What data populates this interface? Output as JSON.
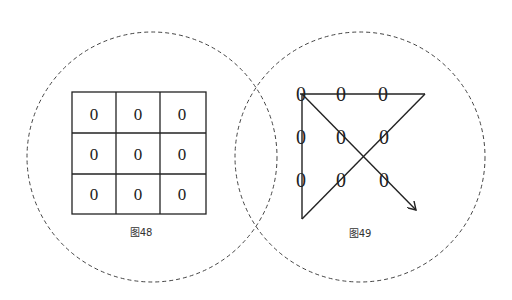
{
  "figures": [
    {
      "id": "fig48",
      "caption": "图48",
      "grid": {
        "rows": 3,
        "cols": 3,
        "cells": [
          [
            "0",
            "0",
            "0"
          ],
          [
            "0",
            "0",
            "0"
          ],
          [
            "0",
            "0",
            "0"
          ]
        ]
      }
    },
    {
      "id": "fig49",
      "caption": "图49",
      "dots": [
        [
          "0",
          "0",
          "0"
        ],
        [
          "0",
          "0",
          "0"
        ],
        [
          "0",
          "0",
          "0"
        ]
      ],
      "path_description": "Four connected straight lines passing through all nine points, ending with an arrow"
    }
  ],
  "colors": {
    "line": "#222222",
    "dashed_circle": "#444444",
    "background": "#ffffff"
  }
}
